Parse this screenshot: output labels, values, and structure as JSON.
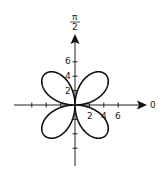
{
  "chart_data": {
    "type": "line",
    "subtype": "polar",
    "title": "",
    "curve": "four-petal rose, petals centered in each quadrant, tangent to axes at the pole",
    "equation_estimate": "r = 6 sin(2θ)",
    "axis_labels": {
      "polar_axis": "0",
      "vertical_axis_top": "π/2"
    },
    "vertical_axis_label": {
      "numerator": "π",
      "denominator": "2"
    },
    "horizontal_tick_labels": [
      "2",
      "4",
      "6"
    ],
    "vertical_tick_labels": [
      "2",
      "4",
      "6"
    ],
    "tick_values": [
      -6,
      -4,
      -2,
      2,
      4,
      6
    ],
    "xlim": [
      -8.5,
      9.5
    ],
    "ylim": [
      -8.5,
      9.5
    ],
    "grid": false,
    "legend": null,
    "line_color": "#111111"
  }
}
